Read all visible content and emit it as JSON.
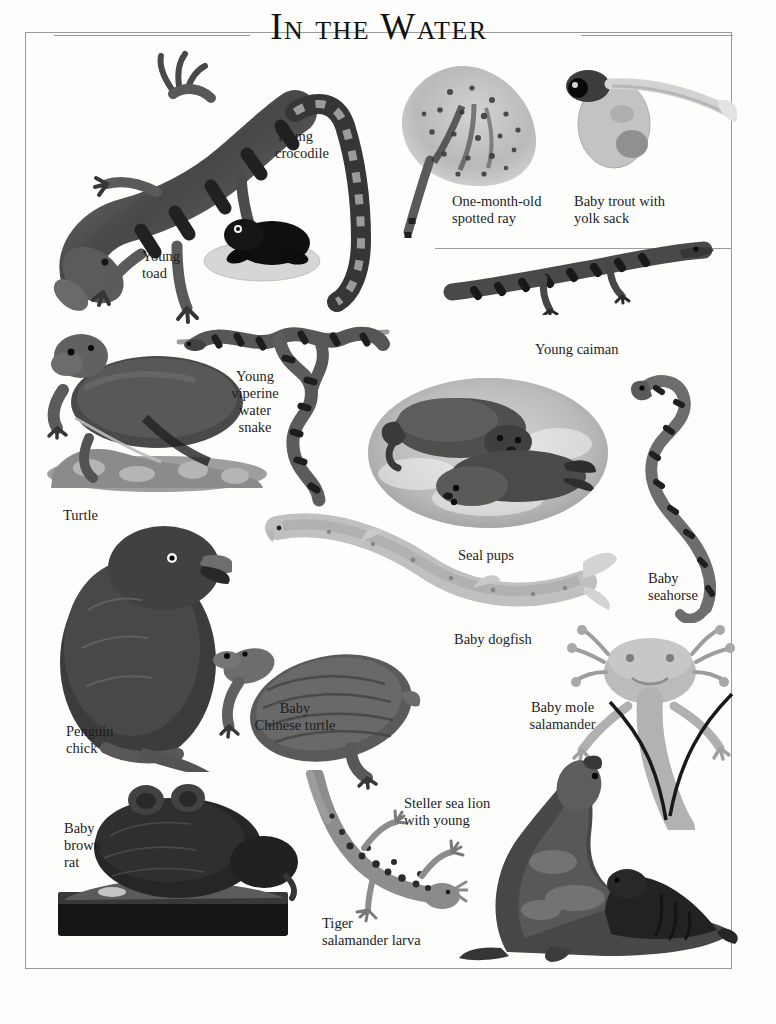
{
  "page": {
    "title": "In the Water",
    "background_color": "#fdfdfc",
    "border_color": "#9a9a9a",
    "text_color": "#1d1d1d"
  },
  "rules": [
    {
      "name": "title-rule-left"
    },
    {
      "name": "title-rule-right"
    },
    {
      "name": "caiman-rule"
    }
  ],
  "captions": [
    {
      "id": "young-crocodile",
      "text": "Young\ncrocodile",
      "align": "left"
    },
    {
      "id": "young-toad",
      "text": "Young\ntoad",
      "align": "left"
    },
    {
      "id": "one-month-old-spotted-ray",
      "text": "One-month-old\nspotted ray",
      "align": "left"
    },
    {
      "id": "baby-trout-with-yolk-sack",
      "text": "Baby trout with\nyolk sack",
      "align": "left"
    },
    {
      "id": "young-caiman",
      "text": "Young caiman",
      "align": "left"
    },
    {
      "id": "young-viperine-water-snake",
      "text": "Young\nviperine\nwater\nsnake",
      "align": "center"
    },
    {
      "id": "turtle",
      "text": "Turtle",
      "align": "left"
    },
    {
      "id": "seal-pups",
      "text": "Seal pups",
      "align": "left"
    },
    {
      "id": "baby-seahorse",
      "text": "Baby\nseahorse",
      "align": "left"
    },
    {
      "id": "baby-dogfish",
      "text": "Baby dogfish",
      "align": "left"
    },
    {
      "id": "baby-mole-salamander",
      "text": "Baby mole\nsalamander",
      "align": "center"
    },
    {
      "id": "penguin-chick",
      "text": "Penguin\nchick",
      "align": "left"
    },
    {
      "id": "baby-chinese-turtle",
      "text": "Baby\nChinese turtle",
      "align": "center"
    },
    {
      "id": "baby-brown-rat",
      "text": "Baby\nbrown\nrat",
      "align": "left"
    },
    {
      "id": "steller-sea-lion-with-young",
      "text": "Steller sea lion\nwith young",
      "align": "left"
    },
    {
      "id": "tiger-salamander-larva",
      "text": "Tiger\nsalamander larva",
      "align": "left"
    }
  ],
  "specimens": [
    {
      "id": "young-crocodile",
      "label": "Young crocodile"
    },
    {
      "id": "young-toad",
      "label": "Young toad"
    },
    {
      "id": "one-month-old-spotted-ray",
      "label": "One-month-old spotted ray"
    },
    {
      "id": "baby-trout-with-yolk-sack",
      "label": "Baby trout with yolk sack"
    },
    {
      "id": "young-caiman",
      "label": "Young caiman"
    },
    {
      "id": "young-viperine-water-snake",
      "label": "Young viperine water snake"
    },
    {
      "id": "turtle",
      "label": "Turtle"
    },
    {
      "id": "seal-pups",
      "label": "Seal pups"
    },
    {
      "id": "baby-seahorse",
      "label": "Baby seahorse"
    },
    {
      "id": "baby-dogfish",
      "label": "Baby dogfish"
    },
    {
      "id": "baby-mole-salamander",
      "label": "Baby mole salamander"
    },
    {
      "id": "penguin-chick",
      "label": "Penguin chick"
    },
    {
      "id": "baby-chinese-turtle",
      "label": "Baby Chinese turtle"
    },
    {
      "id": "baby-brown-rat",
      "label": "Baby brown rat"
    },
    {
      "id": "tiger-salamander-larva",
      "label": "Tiger salamander larva"
    },
    {
      "id": "steller-sea-lion-with-young",
      "label": "Steller sea lion with young"
    }
  ]
}
